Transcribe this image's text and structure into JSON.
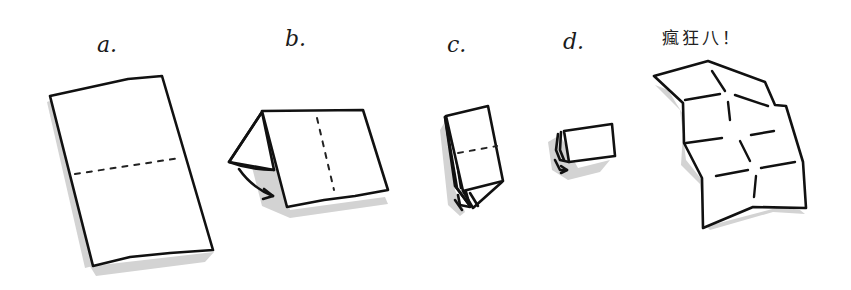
{
  "diagram": {
    "steps": [
      {
        "id": "a",
        "label": "a.",
        "description": "Flat sheet with horizontal dotted fold line"
      },
      {
        "id": "b",
        "label": "b.",
        "description": "Sheet folded in half, flap folding back with arrow; vertical dotted fold line"
      },
      {
        "id": "c",
        "label": "c.",
        "description": "Folded again, horizontal dotted fold line, arrow at bottom"
      },
      {
        "id": "d",
        "label": "d.",
        "description": "Small folded packet with arrow"
      },
      {
        "id": "result",
        "label": "瘋狂八！",
        "description": "Unfolded sheet showing creases forming eight panels"
      }
    ],
    "colors": {
      "ink": "#111111",
      "shadow": "#d3d3d3",
      "background": "#ffffff"
    }
  }
}
